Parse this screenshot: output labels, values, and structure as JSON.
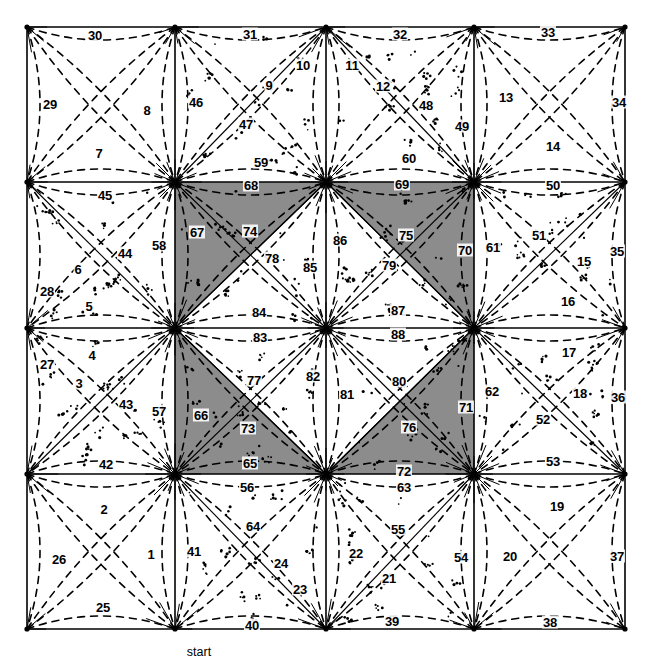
{
  "figure": {
    "caption": "start",
    "caption_x": 199,
    "caption_y": 652,
    "colors": {
      "shaded_fill": "#8c8c8c",
      "line": "#000000",
      "background": "#ffffff"
    },
    "grid": {
      "x": [
        27,
        175,
        326,
        474,
        625
      ],
      "y": [
        27,
        182,
        328,
        474,
        629
      ]
    },
    "shaded_triangles": [
      {
        "name": "center-top-left-upper",
        "points": "175,182 326,182 175,328"
      },
      {
        "name": "center-top-right-upper",
        "points": "326,182 474,182 474,328"
      },
      {
        "name": "center-bottom-left-lower",
        "points": "175,328 175,474 326,474"
      },
      {
        "name": "center-bottom-right-lower",
        "points": "326,474 474,474 474,328"
      }
    ]
  },
  "labels": [
    {
      "id": 1,
      "text": "1",
      "x": 151,
      "y": 554
    },
    {
      "id": 2,
      "text": "2",
      "x": 104,
      "y": 509
    },
    {
      "id": 3,
      "text": "3",
      "x": 79,
      "y": 383
    },
    {
      "id": 4,
      "text": "4",
      "x": 92,
      "y": 355
    },
    {
      "id": 5,
      "text": "5",
      "x": 89,
      "y": 306
    },
    {
      "id": 6,
      "text": "6",
      "x": 78,
      "y": 269
    },
    {
      "id": 7,
      "text": "7",
      "x": 99,
      "y": 153
    },
    {
      "id": 8,
      "text": "8",
      "x": 147,
      "y": 110
    },
    {
      "id": 9,
      "text": "9",
      "x": 269,
      "y": 85
    },
    {
      "id": 10,
      "text": "10",
      "x": 303,
      "y": 65
    },
    {
      "id": 11,
      "text": "11",
      "x": 352,
      "y": 65
    },
    {
      "id": 12,
      "text": "12",
      "x": 383,
      "y": 86
    },
    {
      "id": 13,
      "text": "13",
      "x": 506,
      "y": 97
    },
    {
      "id": 14,
      "text": "14",
      "x": 553,
      "y": 146
    },
    {
      "id": 15,
      "text": "15",
      "x": 584,
      "y": 261
    },
    {
      "id": 16,
      "text": "16",
      "x": 568,
      "y": 301
    },
    {
      "id": 17,
      "text": "17",
      "x": 569,
      "y": 352
    },
    {
      "id": 18,
      "text": "18",
      "x": 580,
      "y": 393
    },
    {
      "id": 19,
      "text": "19",
      "x": 557,
      "y": 506
    },
    {
      "id": 20,
      "text": "20",
      "x": 510,
      "y": 556
    },
    {
      "id": 21,
      "text": "21",
      "x": 389,
      "y": 578
    },
    {
      "id": 22,
      "text": "22",
      "x": 356,
      "y": 553
    },
    {
      "id": 23,
      "text": "23",
      "x": 300,
      "y": 589
    },
    {
      "id": 24,
      "text": "24",
      "x": 281,
      "y": 563
    },
    {
      "id": 25,
      "text": "25",
      "x": 103,
      "y": 607
    },
    {
      "id": 26,
      "text": "26",
      "x": 59,
      "y": 559
    },
    {
      "id": 27,
      "text": "27",
      "x": 47,
      "y": 364
    },
    {
      "id": 28,
      "text": "28",
      "x": 47,
      "y": 291
    },
    {
      "id": 29,
      "text": "29",
      "x": 50,
      "y": 104
    },
    {
      "id": 30,
      "text": "30",
      "x": 95,
      "y": 35
    },
    {
      "id": 31,
      "text": "31",
      "x": 250,
      "y": 34
    },
    {
      "id": 32,
      "text": "32",
      "x": 400,
      "y": 34
    },
    {
      "id": 33,
      "text": "33",
      "x": 548,
      "y": 32
    },
    {
      "id": 34,
      "text": "34",
      "x": 619,
      "y": 102
    },
    {
      "id": 35,
      "text": "35",
      "x": 617,
      "y": 251
    },
    {
      "id": 36,
      "text": "36",
      "x": 618,
      "y": 397
    },
    {
      "id": 37,
      "text": "37",
      "x": 617,
      "y": 556
    },
    {
      "id": 38,
      "text": "38",
      "x": 550,
      "y": 622
    },
    {
      "id": 39,
      "text": "39",
      "x": 392,
      "y": 621
    },
    {
      "id": 40,
      "text": "40",
      "x": 252,
      "y": 625
    },
    {
      "id": 41,
      "text": "41",
      "x": 194,
      "y": 551
    },
    {
      "id": 42,
      "text": "42",
      "x": 106,
      "y": 464
    },
    {
      "id": 43,
      "text": "43",
      "x": 126,
      "y": 404
    },
    {
      "id": 44,
      "text": "44",
      "x": 125,
      "y": 253
    },
    {
      "id": 45,
      "text": "45",
      "x": 105,
      "y": 195
    },
    {
      "id": 46,
      "text": "46",
      "x": 196,
      "y": 102
    },
    {
      "id": 47,
      "text": "47",
      "x": 246,
      "y": 124
    },
    {
      "id": 48,
      "text": "48",
      "x": 426,
      "y": 105
    },
    {
      "id": 49,
      "text": "49",
      "x": 462,
      "y": 126
    },
    {
      "id": 50,
      "text": "50",
      "x": 553,
      "y": 185
    },
    {
      "id": 51,
      "text": "51",
      "x": 539,
      "y": 235
    },
    {
      "id": 52,
      "text": "52",
      "x": 543,
      "y": 419
    },
    {
      "id": 53,
      "text": "53",
      "x": 553,
      "y": 461
    },
    {
      "id": 54,
      "text": "54",
      "x": 461,
      "y": 557
    },
    {
      "id": 55,
      "text": "55",
      "x": 398,
      "y": 529
    },
    {
      "id": 56,
      "text": "56",
      "x": 247,
      "y": 487
    },
    {
      "id": 57,
      "text": "57",
      "x": 159,
      "y": 411
    },
    {
      "id": 58,
      "text": "58",
      "x": 159,
      "y": 245
    },
    {
      "id": 59,
      "text": "59",
      "x": 261,
      "y": 162
    },
    {
      "id": 60,
      "text": "60",
      "x": 409,
      "y": 158
    },
    {
      "id": 61,
      "text": "61",
      "x": 493,
      "y": 247
    },
    {
      "id": 62,
      "text": "62",
      "x": 492,
      "y": 391
    },
    {
      "id": 63,
      "text": "63",
      "x": 404,
      "y": 487
    },
    {
      "id": 64,
      "text": "64",
      "x": 253,
      "y": 526
    },
    {
      "id": 65,
      "text": "65",
      "x": 250,
      "y": 463
    },
    {
      "id": 66,
      "text": "66",
      "x": 201,
      "y": 415
    },
    {
      "id": 67,
      "text": "67",
      "x": 197,
      "y": 232
    },
    {
      "id": 68,
      "text": "68",
      "x": 251,
      "y": 185
    },
    {
      "id": 69,
      "text": "69",
      "x": 402,
      "y": 184
    },
    {
      "id": 70,
      "text": "70",
      "x": 465,
      "y": 250
    },
    {
      "id": 71,
      "text": "71",
      "x": 466,
      "y": 407
    },
    {
      "id": 72,
      "text": "72",
      "x": 404,
      "y": 471
    },
    {
      "id": 73,
      "text": "73",
      "x": 248,
      "y": 428
    },
    {
      "id": 74,
      "text": "74",
      "x": 250,
      "y": 231
    },
    {
      "id": 75,
      "text": "75",
      "x": 406,
      "y": 235
    },
    {
      "id": 76,
      "text": "76",
      "x": 409,
      "y": 427
    },
    {
      "id": 77,
      "text": "77",
      "x": 254,
      "y": 380
    },
    {
      "id": 78,
      "text": "78",
      "x": 272,
      "y": 258
    },
    {
      "id": 79,
      "text": "79",
      "x": 389,
      "y": 265
    },
    {
      "id": 80,
      "text": "80",
      "x": 399,
      "y": 381
    },
    {
      "id": 81,
      "text": "81",
      "x": 347,
      "y": 394
    },
    {
      "id": 82,
      "text": "82",
      "x": 313,
      "y": 376
    },
    {
      "id": 83,
      "text": "83",
      "x": 260,
      "y": 337
    },
    {
      "id": 84,
      "text": "84",
      "x": 259,
      "y": 312
    },
    {
      "id": 85,
      "text": "85",
      "x": 310,
      "y": 267
    },
    {
      "id": 86,
      "text": "86",
      "x": 340,
      "y": 240
    },
    {
      "id": 87,
      "text": "87",
      "x": 398,
      "y": 310
    },
    {
      "id": 88,
      "text": "88",
      "x": 398,
      "y": 334
    }
  ]
}
